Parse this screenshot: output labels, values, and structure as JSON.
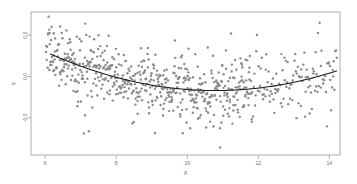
{
  "chart_data": {
    "type": "scatter",
    "title": "",
    "subtitle": "",
    "xlabel": "X",
    "ylabel": "Y",
    "xlim": [
      5.6,
      14.3
    ],
    "ylim": [
      -0.95,
      0.78
    ],
    "grid": false,
    "legend": null,
    "xticks": [
      6,
      8,
      10,
      12,
      14
    ],
    "xticklabels": [
      "6",
      "8",
      "10",
      "12",
      "14"
    ],
    "yticks": [
      0.5,
      0.0,
      -0.5
    ],
    "yticklabels": [
      "0.5",
      "0.0",
      "-0.5"
    ],
    "series": [
      {
        "name": "observations",
        "type": "scatter",
        "marker": "circle",
        "color": "#8a8a8a",
        "size": 1.2,
        "n_points": 700,
        "x": [
          6.02,
          6.05,
          6.07,
          6.09,
          6.11,
          6.13,
          6.15,
          6.17,
          6.19,
          6.21,
          6.23,
          6.25,
          6.27,
          6.29,
          6.31,
          6.33,
          6.35,
          6.37,
          6.39,
          6.41,
          6.43,
          6.45,
          6.47,
          6.49,
          6.51,
          6.53,
          6.55,
          6.57,
          6.59,
          6.61,
          6.63,
          6.65,
          6.67,
          6.69,
          6.71,
          6.73,
          6.75,
          6.77,
          6.79,
          6.81,
          6.83,
          6.85,
          6.87,
          6.89,
          6.91,
          6.93,
          6.95,
          6.97,
          6.99,
          7.01,
          7.03,
          7.05,
          7.07,
          7.09,
          7.11,
          7.13,
          7.15,
          7.17,
          7.19,
          7.21,
          7.23,
          7.25,
          7.27,
          7.29,
          7.31,
          7.33,
          7.35,
          7.37,
          7.39,
          7.41,
          7.43,
          7.45,
          7.47,
          7.49,
          7.51,
          7.53,
          7.55,
          7.57,
          7.59,
          7.61,
          7.63,
          7.65,
          7.67,
          7.69,
          7.71,
          7.73,
          7.75,
          7.77,
          7.79,
          7.81,
          7.83,
          7.85,
          7.87,
          7.89,
          7.91,
          7.93,
          7.95,
          7.97,
          7.99,
          8.01,
          8.03,
          8.05,
          8.07,
          8.09,
          8.11,
          8.13,
          8.15,
          8.17,
          8.19,
          8.21,
          8.23,
          8.25,
          8.27,
          8.29,
          8.31,
          8.33,
          8.35,
          8.37,
          8.39,
          8.41,
          8.43,
          8.45,
          8.47,
          8.49,
          8.51,
          8.53,
          8.55,
          8.57,
          8.59,
          8.61,
          8.63,
          8.65,
          8.67,
          8.69,
          8.71,
          8.73,
          8.75,
          8.77,
          8.79,
          8.81,
          8.83,
          8.85,
          8.87,
          8.89,
          8.91,
          8.93,
          8.95,
          8.97,
          8.99,
          9.01,
          9.03,
          9.05,
          9.07,
          9.09,
          9.11,
          9.13,
          9.15,
          9.17,
          9.19,
          9.21,
          9.23,
          9.25,
          9.27,
          9.29,
          9.31,
          9.33,
          9.35,
          9.37,
          9.39,
          9.41,
          9.43,
          9.45,
          9.47,
          9.49,
          9.51,
          9.53,
          9.55,
          9.57,
          9.59,
          9.61,
          9.63,
          9.65,
          9.67,
          9.69,
          9.71,
          9.73,
          9.75,
          9.77,
          9.79,
          9.81,
          9.83,
          9.85,
          9.87,
          9.89,
          9.91,
          9.93,
          9.95,
          9.97,
          9.99,
          10.01,
          10.03,
          10.05,
          10.07,
          10.09,
          10.11,
          10.13,
          10.15,
          10.17,
          10.19,
          10.21,
          10.23,
          10.25,
          10.27,
          10.29,
          10.31,
          10.33,
          10.35,
          10.37,
          10.39,
          10.41,
          10.43,
          10.45,
          10.47,
          10.49,
          10.51,
          10.53,
          10.55,
          10.57,
          10.59,
          10.61,
          10.63,
          10.65,
          10.67,
          10.69,
          10.71,
          10.73,
          10.75,
          10.77,
          10.79,
          10.81,
          10.83,
          10.85,
          10.87,
          10.89,
          10.91,
          10.93,
          10.95,
          10.97,
          10.99,
          11.01,
          11.03,
          11.05,
          11.07,
          11.09,
          11.11,
          11.13,
          11.15,
          11.17,
          11.19,
          11.21,
          11.23,
          11.25,
          11.27,
          11.29,
          11.31,
          11.33,
          11.35,
          11.37,
          11.39,
          11.41,
          11.43,
          11.45,
          11.47,
          11.49,
          11.51,
          11.53,
          11.55,
          11.57,
          11.59,
          11.61,
          11.63,
          11.65,
          11.67,
          11.69,
          11.71,
          11.73,
          11.75,
          11.77,
          11.79,
          11.81,
          11.83,
          11.85,
          11.87,
          11.89,
          11.91,
          11.93,
          11.95,
          11.97,
          11.99,
          12.01,
          12.03,
          12.05,
          12.07,
          12.09,
          12.11,
          12.13,
          12.15,
          12.17,
          12.19,
          12.21,
          12.23,
          12.25,
          12.27,
          12.29,
          12.31,
          12.33,
          12.35,
          12.37,
          12.39,
          12.41,
          12.43,
          12.45,
          12.47,
          12.49,
          12.51,
          12.53,
          12.55,
          12.57,
          12.59,
          12.61,
          12.63,
          12.65,
          12.67,
          12.69,
          12.71,
          12.73,
          12.75,
          12.77,
          12.79,
          12.81,
          12.83,
          12.85,
          12.87,
          12.89,
          12.91,
          12.93,
          12.95,
          12.97,
          12.99,
          13.01,
          13.03,
          13.05,
          13.07,
          13.09,
          13.11,
          13.13,
          13.15,
          13.17,
          13.19,
          13.21,
          13.23,
          13.25,
          13.27,
          13.29,
          13.31,
          13.33,
          13.35,
          13.37,
          13.39,
          13.41,
          13.43,
          13.45,
          13.47,
          13.49,
          13.51,
          13.53,
          13.55,
          13.57,
          13.59,
          13.61,
          13.63,
          13.65,
          13.67,
          13.69,
          13.71,
          13.73,
          13.75,
          13.77,
          13.79,
          13.81,
          13.83,
          13.85,
          13.87,
          13.89,
          13.91,
          13.93,
          13.95,
          13.97,
          13.99,
          14.01,
          14.03,
          14.05,
          14.07,
          14.09,
          14.11,
          14.13,
          14.15,
          14.17,
          14.19,
          14.21
        ],
        "note": "x sampled roughly uniformly on [6, 14.2]; y = fit(x) + noise"
      },
      {
        "name": "fitted-curve",
        "type": "line",
        "color": "#1a1a1a",
        "width": 1.1,
        "model": "quadratic",
        "coefficients": {
          "a": 0.0205,
          "b": -0.4425,
          "c": 2.2175
        },
        "equation": "y = 0.0205*x^2 - 0.4425*x + 2.2175",
        "x_start": 6.15,
        "x_end": 14.2,
        "vertex": {
          "x": 10.79,
          "y": -0.17
        },
        "endpoints": [
          {
            "x": 6.15,
            "y": 0.27
          },
          {
            "x": 14.2,
            "y": -0.09
          }
        ]
      }
    ],
    "noise": {
      "distribution": "normal",
      "sd": 0.19
    },
    "frame": {
      "left": 31,
      "right": 340,
      "top": 12,
      "bottom": 155,
      "color": "#9a9a9a"
    },
    "background": "#ffffff"
  }
}
